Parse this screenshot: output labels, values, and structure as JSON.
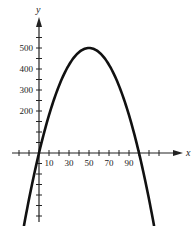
{
  "chart_data": {
    "type": "line",
    "title": "",
    "xlabel": "x",
    "ylabel": "y",
    "x_tick_labels": [
      "10",
      "30",
      "50",
      "70",
      "90"
    ],
    "y_tick_labels": [
      "200",
      "300",
      "400",
      "500"
    ],
    "x_minor_tick_step": 10,
    "y_minor_tick_step": 50,
    "xlim": [
      -30,
      120
    ],
    "ylim": [
      -300,
      600
    ],
    "grid": false,
    "legend": null,
    "series": [
      {
        "name": "parabola",
        "description": "Downward-opening parabola, roots near x=0 and x=100, vertex at (50, 500)",
        "x": [
          -15,
          -10,
          0,
          10,
          20,
          30,
          40,
          50,
          60,
          70,
          80,
          90,
          100,
          110,
          115
        ],
        "y": [
          -345,
          -220,
          0,
          180,
          320,
          420,
          480,
          500,
          480,
          420,
          320,
          180,
          0,
          -220,
          -345
        ]
      }
    ]
  },
  "colors": {
    "curve": "#111111",
    "axes": "#222222",
    "background": "#ffffff"
  }
}
